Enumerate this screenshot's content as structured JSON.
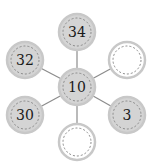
{
  "diagram": {
    "type": "hub-and-spoke",
    "colors": {
      "filled": "#d4d4d4",
      "empty": "#ffffff",
      "ring": "#c8c8c8",
      "dash": "#8a8a8a",
      "edge": "#8c8c8c",
      "text": "#1a1a1a"
    },
    "center": {
      "id": "center",
      "label": "10",
      "cx": 77,
      "cy": 87,
      "filled": true
    },
    "nodes": [
      {
        "id": "top",
        "label": "34",
        "cx": 77,
        "cy": 32,
        "filled": true
      },
      {
        "id": "upper-left",
        "label": "32",
        "cx": 25,
        "cy": 60,
        "filled": true
      },
      {
        "id": "upper-right",
        "label": "",
        "cx": 127,
        "cy": 60,
        "filled": false
      },
      {
        "id": "lower-left",
        "label": "30",
        "cx": 25,
        "cy": 115,
        "filled": true
      },
      {
        "id": "lower-right",
        "label": "3",
        "cx": 127,
        "cy": 115,
        "filled": true
      },
      {
        "id": "bottom",
        "label": "",
        "cx": 77,
        "cy": 142,
        "filled": false
      }
    ],
    "radius": 18
  }
}
